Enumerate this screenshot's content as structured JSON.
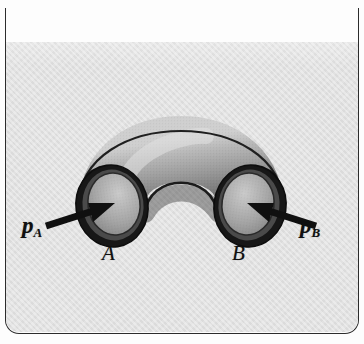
{
  "figure": {
    "name": "pipe-elbow-pressure-diagram",
    "panel_color": "#e2e2e2",
    "border_color": "#2c2c2c",
    "page_color": "#fdfdfd",
    "pipe": {
      "body_light": "#d8d8d8",
      "body_mid": "#9a9a9a",
      "body_dark": "#6d6d6d",
      "outline": "#1c1c1c",
      "rim_dark": "#141414",
      "bore_fill": "#b4b4b4"
    },
    "arrow_color": "#101010"
  },
  "labels": {
    "pressure_a": "p",
    "pressure_a_sub": "A",
    "pressure_b": "p",
    "pressure_b_sub": "B",
    "point_a": "A",
    "point_b": "B"
  }
}
